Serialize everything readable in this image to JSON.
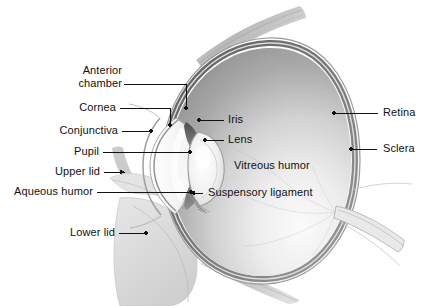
{
  "figure": {
    "kind": "anatomical-illustration",
    "background_color": "#ffffff",
    "label_text_color": "#111111",
    "leader_line_color": "#111111"
  },
  "labels_left": [
    {
      "id": "anterior-chamber",
      "line1": "Anterior",
      "line2": "chamber"
    },
    {
      "id": "cornea",
      "text": "Cornea"
    },
    {
      "id": "conjunctiva",
      "text": "Conjunctiva"
    },
    {
      "id": "pupil",
      "text": "Pupil"
    },
    {
      "id": "upper-lid",
      "text": "Upper lid"
    },
    {
      "id": "aqueous-humor",
      "text": "Aqueous humor"
    },
    {
      "id": "lower-lid",
      "text": "Lower lid"
    }
  ],
  "labels_right": [
    {
      "id": "retina",
      "text": "Retina"
    },
    {
      "id": "sclera",
      "text": "Sclera"
    }
  ],
  "labels_inner": [
    {
      "id": "iris",
      "text": "Iris"
    },
    {
      "id": "lens",
      "text": "Lens"
    },
    {
      "id": "vitreous-humor",
      "text": "Vitreous humor"
    },
    {
      "id": "suspensory-ligament",
      "text": "Suspensory ligament"
    }
  ],
  "palette": {
    "sclera_outline": "#8d8d8d",
    "retina_band": "#6e6e6e",
    "vitreous_dark": "#8f8f8f",
    "vitreous_light": "#f2f2f2",
    "lens_fill": "#efefef",
    "iris_dark": "#5a5a5a",
    "eyelid_gray": "#dcdcdc",
    "muscle_gray": "#b5b5b5",
    "cornea_white": "#fbfbfb"
  }
}
